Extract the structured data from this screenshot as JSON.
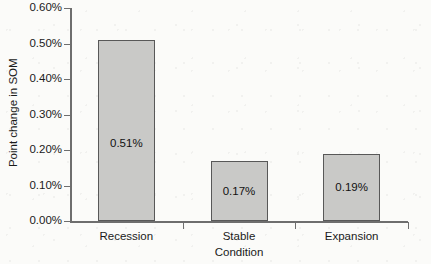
{
  "chart_data": {
    "type": "bar",
    "title": "",
    "xlabel": "Condition",
    "ylabel": "Point change in SOM",
    "categories": [
      "Recession",
      "Stable",
      "Expansion"
    ],
    "values": [
      0.51,
      0.17,
      0.19
    ],
    "value_labels": [
      "0.51%",
      "0.17%",
      "0.19%"
    ],
    "ylim": [
      0.0,
      0.6
    ],
    "ytick_values": [
      0.6,
      0.5,
      0.4,
      0.3,
      0.2,
      0.1,
      0.0
    ],
    "ytick_labels": [
      "0.60%",
      "0.50%",
      "0.40%",
      "0.30%",
      "0.20%",
      "0.10%",
      "0.00%"
    ],
    "grid": false,
    "legend": false,
    "bar_color": "#c9c9c7",
    "bar_border_color": "#585858",
    "axis_color": "#6e6e6e",
    "background": "#fbfbf9"
  }
}
